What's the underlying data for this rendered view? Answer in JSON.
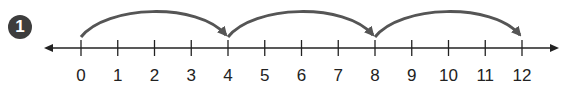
{
  "problem": {
    "number": "1"
  },
  "number_line": {
    "min": 0,
    "max": 12,
    "step": 1,
    "labels": [
      "0",
      "1",
      "2",
      "3",
      "4",
      "5",
      "6",
      "7",
      "8",
      "9",
      "10",
      "11",
      "12"
    ],
    "jumps": [
      {
        "from": 0,
        "to": 4
      },
      {
        "from": 4,
        "to": 8
      },
      {
        "from": 8,
        "to": 12
      }
    ],
    "jump_size": 4,
    "colors": {
      "line": "#222222",
      "arc": "#555555",
      "badge": "#3d3d3d"
    }
  }
}
